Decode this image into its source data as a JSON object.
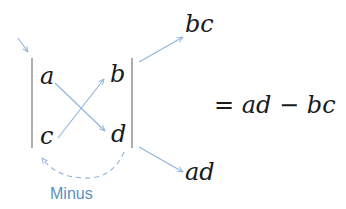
{
  "diagram": {
    "matrix": {
      "a": "a",
      "b": "b",
      "c": "c",
      "d": "d"
    },
    "products": {
      "top": "bc",
      "bottom": "ad"
    },
    "result": "= ad − bc",
    "minus_label": "Minus",
    "colors": {
      "arrow": "#8fb4dc",
      "label": "#5b8fc4",
      "text": "#1a1a1a",
      "bar": "#777777"
    }
  }
}
